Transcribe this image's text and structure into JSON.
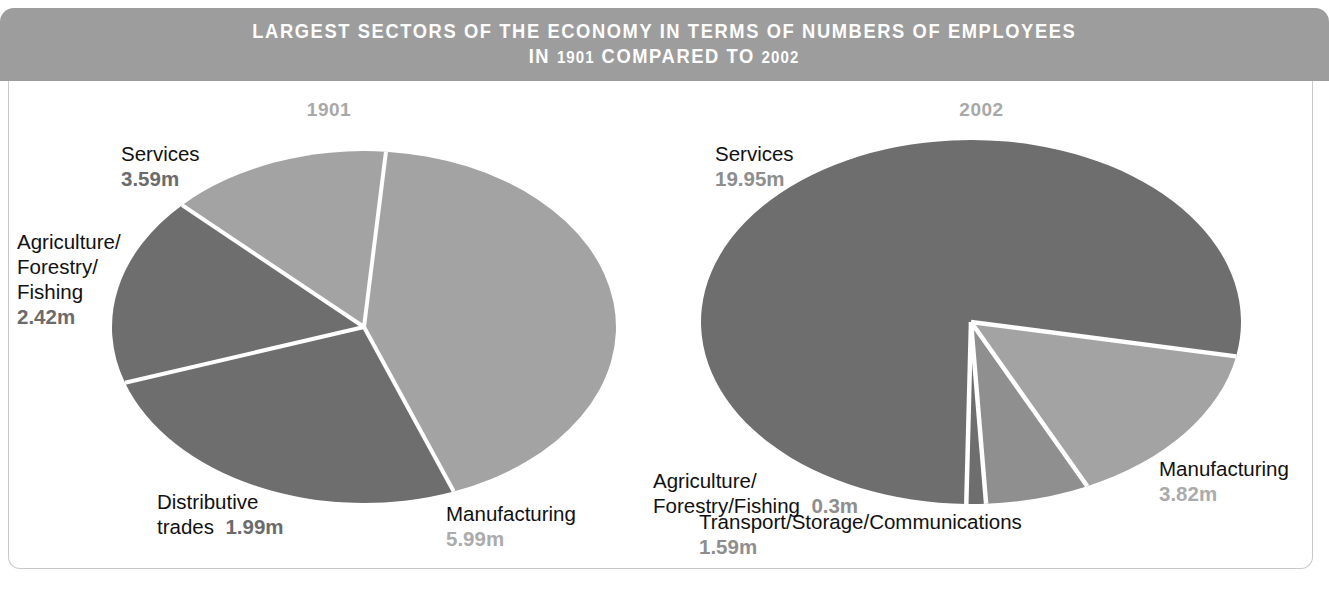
{
  "header": {
    "line1": "LARGEST SECTORS OF THE ECONOMY IN TERMS OF NUMBERS OF EMPLOYEES",
    "line2_pre": "IN ",
    "line2_y1": "1901",
    "line2_mid": " COMPARED TO ",
    "line2_y2": "2002"
  },
  "colors": {
    "band": "#9d9d9d",
    "frame_border": "#c9c9c9",
    "slice_dark": "#6e6e6e",
    "slice_mid": "#8f8f8f",
    "slice_light": "#a3a3a3",
    "divider": "#ffffff",
    "year_text": "#a8a8a8",
    "label_text": "#111111"
  },
  "panels": [
    {
      "id": "1901",
      "year": "1901",
      "labels": [
        {
          "name": "services",
          "line1": "Services",
          "value": "3.59m",
          "value_tone": "dark",
          "stacked": true,
          "x": 112,
          "y": 60
        },
        {
          "name": "agriculture",
          "line1": "Agriculture/",
          "line2": "Forestry/",
          "line3": "Fishing",
          "value": "2.42m",
          "value_tone": "dark",
          "stacked": true,
          "x": 8,
          "y": 148
        },
        {
          "name": "distributive",
          "line1": "Distributive",
          "line2_inline": "trades",
          "value": "1.99m",
          "value_tone": "dark",
          "inline": true,
          "x": 148,
          "y": 408
        },
        {
          "name": "manufacturing",
          "line1": "Manufacturing",
          "value": "5.99m",
          "value_tone": "light",
          "stacked": true,
          "x": 437,
          "y": 420
        }
      ]
    },
    {
      "id": "2002",
      "year": "2002",
      "labels": [
        {
          "name": "services",
          "line1": "Services",
          "value": "19.95m",
          "value_tone": "mid",
          "stacked": true,
          "x": 66,
          "y": 60
        },
        {
          "name": "agriculture",
          "line1": "Agriculture/",
          "line2_inline": "Forestry/Fishing",
          "value": "0.3m",
          "value_tone": "mid",
          "inline": true,
          "x": 4,
          "y": 387
        },
        {
          "name": "transport",
          "line1": "Transport/Storage/Communications",
          "value": "1.59m",
          "value_tone": "mid",
          "stacked": true,
          "x": 50,
          "y": 428
        },
        {
          "name": "manufacturing",
          "line1": "Manufacturing",
          "value": "3.82m",
          "value_tone": "light",
          "stacked": true,
          "x": 510,
          "y": 375
        }
      ]
    }
  ],
  "chart_data": [
    {
      "type": "pie",
      "title": "1901",
      "unit": "m",
      "total": 13.99,
      "labels": [
        "Manufacturing",
        "Services",
        "Agriculture/Forestry/Fishing",
        "Distributive trades"
      ],
      "values": [
        5.99,
        3.59,
        2.42,
        1.99
      ],
      "percentages": [
        42.8,
        25.7,
        17.3,
        14.2
      ],
      "slice_colors": [
        "#a3a3a3",
        "#6e6e6e",
        "#6e6e6e",
        "#a3a3a3"
      ],
      "legend": "none",
      "annotations": [
        "Services 3.59m",
        "Agriculture/Forestry/Fishing 2.42m",
        "Distributive trades 1.99m",
        "Manufacturing 5.99m"
      ]
    },
    {
      "type": "pie",
      "title": "2002",
      "unit": "m",
      "total": 25.66,
      "labels": [
        "Services",
        "Manufacturing",
        "Transport/Storage/Communications",
        "Agriculture/Forestry/Fishing"
      ],
      "values": [
        19.95,
        3.82,
        1.59,
        0.3
      ],
      "percentages": [
        77.7,
        14.9,
        6.2,
        1.2
      ],
      "slice_colors": [
        "#6e6e6e",
        "#a3a3a3",
        "#8f8f8f",
        "#6e6e6e"
      ],
      "legend": "none",
      "annotations": [
        "Services 19.95m",
        "Agriculture/Forestry/Fishing 0.3m",
        "Transport/Storage/Communications 1.59m",
        "Manufacturing 3.82m"
      ]
    }
  ]
}
